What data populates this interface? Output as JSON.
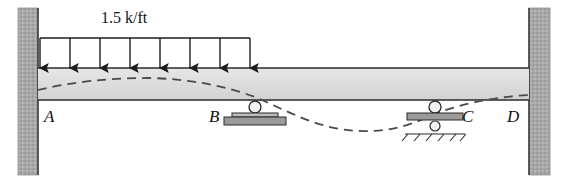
{
  "diagram": {
    "type": "structural-beam-deflection",
    "load": {
      "label": "1.5 k/ft",
      "magnitude": 1.5,
      "units": "k/ft",
      "direction": "down",
      "arrow_count": 8,
      "start_x": 40,
      "end_x": 250,
      "top_line_y": 38,
      "tip_y": 69,
      "label_x": 150,
      "label_y": 12
    },
    "beam": {
      "left_x": 38,
      "right_x": 529,
      "top_y": 68,
      "bottom_y": 100,
      "fill_color": "#dedede",
      "edge_color": "#3a3a3a"
    },
    "walls": [
      {
        "name": "left-wall",
        "x": 18,
        "y": 8,
        "width": 20,
        "height": 167,
        "fill_color": "#a8a8a8"
      },
      {
        "name": "right-wall",
        "x": 529,
        "y": 8,
        "width": 21,
        "height": 167,
        "fill_color": "#a8a8a8"
      }
    ],
    "supports": [
      {
        "name": "support-b",
        "kind": "roller",
        "x": 255,
        "circle_cy": 107,
        "circle_r": 6,
        "plate_y": 113,
        "plate_width": 46,
        "plate_height": 4,
        "base_y": 117,
        "base_width": 62,
        "base_height": 8,
        "fill_color": "#9a9a9a"
      },
      {
        "name": "support-c",
        "kind": "roller-on-ground",
        "x": 435,
        "circle_cy": 107,
        "circle_r": 6,
        "plate_y": 113,
        "plate_width": 56,
        "plate_height": 7,
        "lower_circle_cy": 126,
        "lower_circle_r": 5,
        "ground_y": 134,
        "ground_width": 60,
        "hatch_count": 5,
        "fill_color": "#9a9a9a"
      }
    ],
    "labels": [
      {
        "name": "label-a",
        "text": "A",
        "x": 44,
        "y": 108
      },
      {
        "name": "label-b",
        "text": "B",
        "x": 209,
        "y": 108
      },
      {
        "name": "label-c",
        "text": "C",
        "x": 462,
        "y": 108
      },
      {
        "name": "label-d",
        "text": "D",
        "x": 507,
        "y": 108
      }
    ],
    "deflection_curve": {
      "name": "deflected-shape",
      "style": "dashed",
      "color": "#4a4a4a",
      "dash_pattern": "9,6",
      "stroke_width": 1.8,
      "description": "Deflected shape: hogs upward between A and B, inflects just past B, sags deeply between B and C, recovers toward D",
      "path": "M 38,90 C 70,82 110,78 150,78 C 190,79 225,86 255,97 C 285,110 310,124 340,129 C 372,134 400,130 428,117 C 452,106 490,97 529,95"
    },
    "colors": {
      "wall_gray": "#a8a8a8",
      "beam_gray": "#dedede",
      "support_gray": "#9a9a9a",
      "line_dark": "#2b2b2b",
      "dash_gray": "#4a4a4a"
    }
  }
}
